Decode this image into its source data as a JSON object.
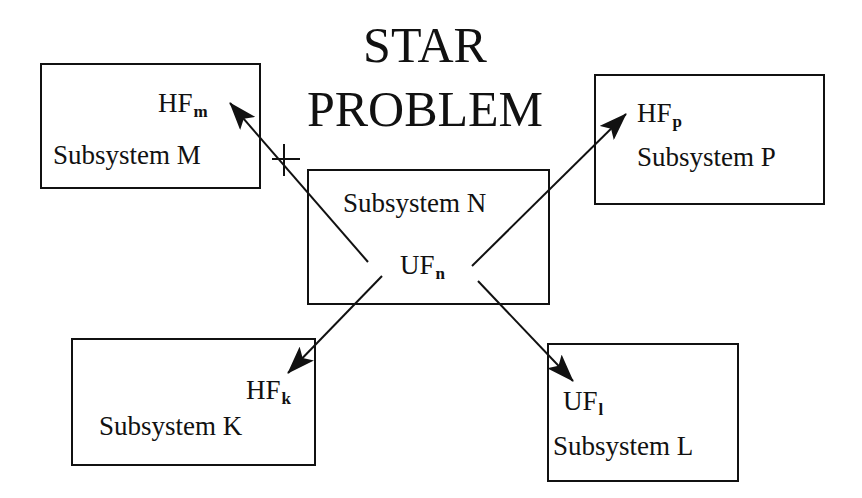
{
  "diagram": {
    "title_line1": "STAR",
    "title_line2": "PROBLEM",
    "center": {
      "name": "Subsystem N",
      "factor": "UF",
      "factor_sub": "n"
    },
    "subsystems": [
      {
        "id": "M",
        "name": "Subsystem M",
        "factor": "HF",
        "factor_sub": "m",
        "connection": "blocked (crossed)"
      },
      {
        "id": "P",
        "name": "Subsystem P",
        "factor": "HF",
        "factor_sub": "p",
        "connection": "arrow"
      },
      {
        "id": "K",
        "name": "Subsystem K",
        "factor": "HF",
        "factor_sub": "k",
        "connection": "arrow"
      },
      {
        "id": "L",
        "name": "Subsystem L",
        "factor": "UF",
        "factor_sub": "l",
        "connection": "arrow"
      }
    ],
    "colors": {
      "line": "#111111",
      "background": "#ffffff"
    }
  }
}
